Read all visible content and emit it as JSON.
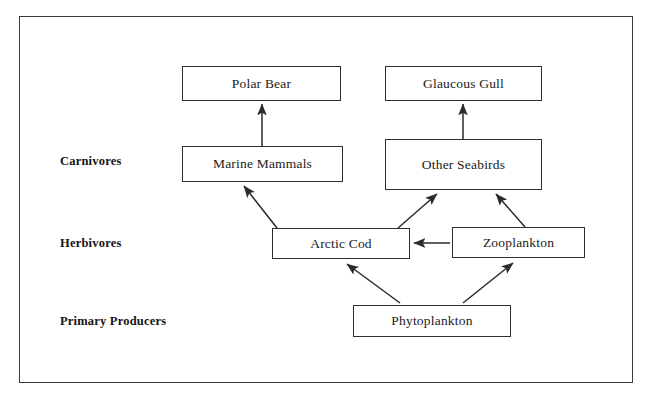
{
  "diagram": {
    "frame": {
      "x": 19,
      "y": 16,
      "width": 614,
      "height": 367,
      "border_color": "#3a3a3a"
    },
    "colors": {
      "background": "#ffffff",
      "box_border": "#2e2e2e",
      "text": "#1a1a1a",
      "arrow": "#2b2b2b"
    },
    "tier_labels": [
      {
        "id": "carnivores",
        "label": "Carnivores",
        "x": 60,
        "y": 154
      },
      {
        "id": "herbivores",
        "label": "Herbivores",
        "x": 60,
        "y": 236
      },
      {
        "id": "primary-producers",
        "label": "Primary Producers",
        "x": 60,
        "y": 314
      }
    ],
    "nodes": [
      {
        "id": "polar-bear",
        "label": "Polar Bear",
        "x": 182,
        "y": 66,
        "width": 159,
        "height": 35
      },
      {
        "id": "glaucous-gull",
        "label": "Glaucous Gull",
        "x": 385,
        "y": 66,
        "width": 157,
        "height": 35
      },
      {
        "id": "marine-mammals",
        "label": "Marine Mammals",
        "x": 182,
        "y": 146,
        "width": 161,
        "height": 36
      },
      {
        "id": "other-seabirds",
        "label": "Other Seabirds",
        "x": 385,
        "y": 139,
        "width": 157,
        "height": 51
      },
      {
        "id": "arctic-cod",
        "label": "Arctic Cod",
        "x": 272,
        "y": 228,
        "width": 138,
        "height": 31
      },
      {
        "id": "zooplankton",
        "label": "Zooplankton",
        "x": 452,
        "y": 227,
        "width": 133,
        "height": 31
      },
      {
        "id": "phytoplankton",
        "label": "Phytoplankton",
        "x": 353,
        "y": 305,
        "width": 158,
        "height": 32
      }
    ],
    "edges": [
      {
        "id": "marine-mammals-to-polar-bear",
        "from": "marine-mammals",
        "to": "polar-bear",
        "x1": 262,
        "y1": 146,
        "x2": 262,
        "y2": 104
      },
      {
        "id": "other-seabirds-to-glaucous-gull",
        "from": "other-seabirds",
        "to": "glaucous-gull",
        "x1": 463,
        "y1": 139,
        "x2": 463,
        "y2": 104
      },
      {
        "id": "arctic-cod-to-marine-mammals",
        "from": "arctic-cod",
        "to": "marine-mammals",
        "x1": 277,
        "y1": 228,
        "x2": 244,
        "y2": 186
      },
      {
        "id": "arctic-cod-to-other-seabirds",
        "from": "arctic-cod",
        "to": "other-seabirds",
        "x1": 398,
        "y1": 228,
        "x2": 437,
        "y2": 194
      },
      {
        "id": "zooplankton-to-other-seabirds",
        "from": "zooplankton",
        "to": "other-seabirds",
        "x1": 525,
        "y1": 227,
        "x2": 496,
        "y2": 194
      },
      {
        "id": "zooplankton-to-arctic-cod",
        "from": "zooplankton",
        "to": "arctic-cod",
        "x1": 450,
        "y1": 243,
        "x2": 414,
        "y2": 243
      },
      {
        "id": "phytoplankton-to-arctic-cod",
        "from": "phytoplankton",
        "to": "arctic-cod",
        "x1": 400,
        "y1": 303,
        "x2": 347,
        "y2": 264
      },
      {
        "id": "phytoplankton-to-zooplankton",
        "from": "phytoplankton",
        "to": "zooplankton",
        "x1": 463,
        "y1": 303,
        "x2": 513,
        "y2": 263
      }
    ]
  }
}
